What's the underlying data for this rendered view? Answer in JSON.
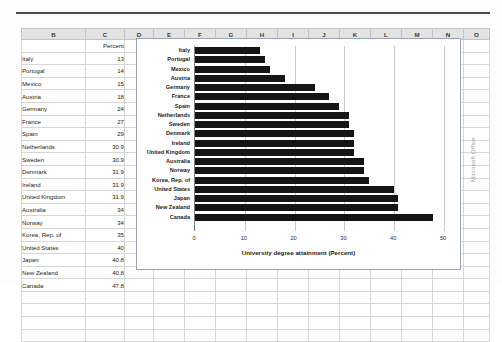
{
  "spreadsheet": {
    "column_headers": [
      "B",
      "C",
      "D",
      "E",
      "F",
      "G",
      "H",
      "I",
      "J",
      "K",
      "L",
      "M",
      "N",
      "O"
    ],
    "header_row": {
      "b": "",
      "c": "Percent"
    },
    "rows": [
      {
        "name": "Italy",
        "percent": "13"
      },
      {
        "name": "Portugal",
        "percent": "14"
      },
      {
        "name": "Mexico",
        "percent": "15"
      },
      {
        "name": "Austria",
        "percent": "18"
      },
      {
        "name": "Germany",
        "percent": "24"
      },
      {
        "name": "France",
        "percent": "27"
      },
      {
        "name": "Spain",
        "percent": "29"
      },
      {
        "name": "Netherlands",
        "percent": "30.9"
      },
      {
        "name": "Sweden",
        "percent": "30.9"
      },
      {
        "name": "Denmark",
        "percent": "31.9"
      },
      {
        "name": "Ireland",
        "percent": "31.9"
      },
      {
        "name": "United Kingdom",
        "percent": "31.9"
      },
      {
        "name": "Australia",
        "percent": "34"
      },
      {
        "name": "Norway",
        "percent": "34"
      },
      {
        "name": "Korea, Rep. of",
        "percent": "35"
      },
      {
        "name": "United States",
        "percent": "40"
      },
      {
        "name": "Japan",
        "percent": "40.8"
      },
      {
        "name": "New Zealand",
        "percent": "40.8"
      },
      {
        "name": "Canada",
        "percent": "47.8"
      }
    ],
    "empty_row_count": 4
  },
  "chart_data": {
    "type": "bar",
    "orientation": "horizontal",
    "title": "",
    "xlabel": "University degree attainment (Percent)",
    "ylabel": "",
    "xlim": [
      0,
      50
    ],
    "xticks": [
      0,
      10,
      20,
      30,
      40,
      50
    ],
    "grid": true,
    "legend": false,
    "bar_color": "#151515",
    "categories": [
      "Italy",
      "Portugal",
      "Mexico",
      "Austria",
      "Germany",
      "France",
      "Spain",
      "Netherlands",
      "Sweden",
      "Denmark",
      "Ireland",
      "United Kingdom",
      "Australia",
      "Norway",
      "Korea, Rep. of",
      "United States",
      "Japan",
      "New Zealand",
      "Canada"
    ],
    "values": [
      13,
      14,
      15,
      18,
      24,
      27,
      29,
      30.9,
      30.9,
      31.9,
      31.9,
      31.9,
      34,
      34,
      35,
      40,
      40.8,
      40.8,
      47.8
    ]
  },
  "watermark": {
    "text": "Microsoft Office"
  }
}
